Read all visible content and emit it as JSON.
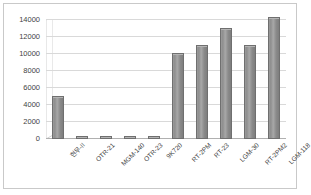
{
  "chart_data": {
    "type": "bar",
    "title": "",
    "subtitle": "",
    "xlabel": "",
    "ylabel": "",
    "ylim": [
      0,
      14000
    ],
    "yticks": [
      0,
      2000,
      4000,
      6000,
      8000,
      10000,
      12000,
      14000
    ],
    "ytick_labels": [
      "0",
      "2000",
      "4000",
      "6000",
      "8000",
      "10000",
      "12000",
      "14000"
    ],
    "grid": true,
    "legend": false,
    "legend_position": "none",
    "style": "3d-column",
    "bar_color": "#939393",
    "bar_edge_color": "#6f6f6f",
    "gridline_color": "#d9d9d9",
    "categories": [
      "현무-II",
      "OTR-21",
      "MGM-140",
      "OTR-23",
      "9K720",
      "RT-2PM",
      "RT-23",
      "LGM-30",
      "RT-2PM2",
      "LGM-118"
    ],
    "values": [
      5000,
      120,
      150,
      280,
      180,
      10000,
      11000,
      13000,
      11000,
      14200
    ]
  },
  "frame": {
    "border_color": "#c9c9c9"
  }
}
